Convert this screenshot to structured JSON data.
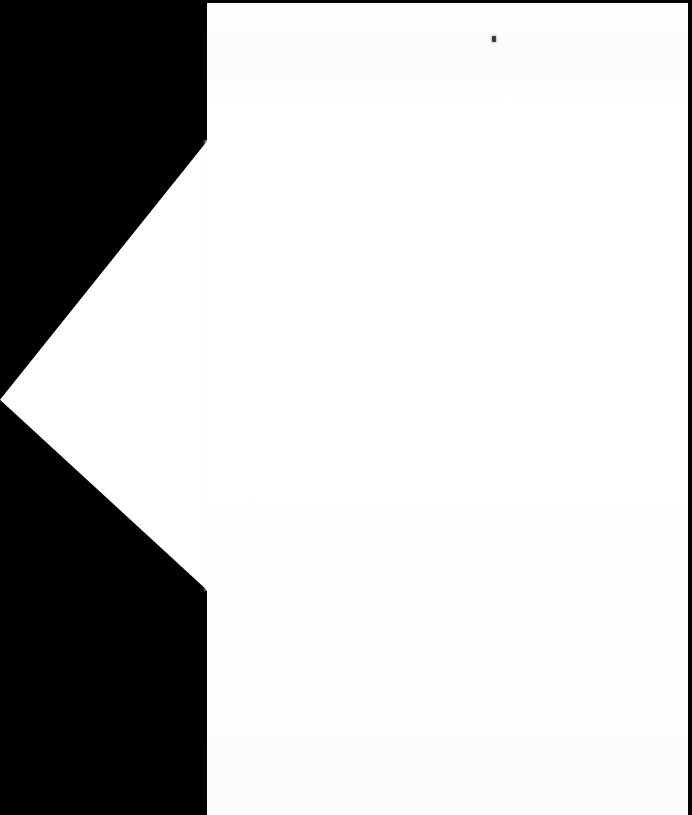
{
  "scan": {
    "title": "Blank scanned document page",
    "background_color": "#000000",
    "paper_color": "#ffffff",
    "width_px": 692,
    "height_px": 815
  },
  "page": {
    "body_label": "page-body",
    "left_px": 207,
    "top_px": 0,
    "width_px": 481,
    "height_px": 815,
    "visible_text": "",
    "note": ""
  },
  "wedge": {
    "label": "page-corner-wedge",
    "tip_x_px": 0,
    "tip_y_px": 400,
    "top_vertex_x_px": 207,
    "top_vertex_y_px": 140,
    "bottom_vertex_x_px": 207,
    "bottom_vertex_y_px": 590,
    "color": "#ffffff"
  },
  "marks": {
    "speck": {
      "label": "ink-speck",
      "x_px": 494,
      "y_px": 39,
      "color": "#3b3b3b"
    }
  },
  "edges": {
    "top_band_color": "#050505",
    "right_band_color": "#030303",
    "left_margin_color": "#000000"
  }
}
